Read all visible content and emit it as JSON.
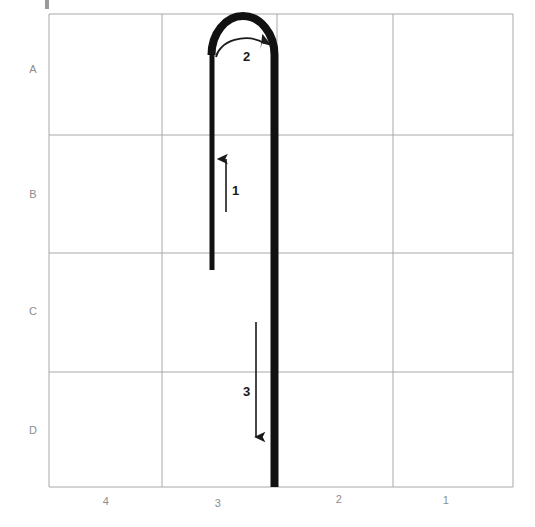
{
  "figure": {
    "title": "",
    "type": "stroke-order-diagram",
    "background_color": "#ffffff",
    "grid_color": "#a8a8a8",
    "stroke_color": "#111111",
    "label_color": "#8d8d8d",
    "step_label_color": "#1a1a1a"
  },
  "grid": {
    "columns": 4,
    "rows": 4,
    "left": 49,
    "top": 14,
    "right": 513,
    "bottom": 487,
    "v_lines": [
      49,
      162,
      277,
      393,
      513
    ],
    "h_lines": [
      14,
      135,
      253,
      372,
      487
    ],
    "row_labels": [
      {
        "text": "A",
        "x": 33,
        "y": 64
      },
      {
        "text": "B",
        "x": 33,
        "y": 189
      },
      {
        "text": "C",
        "x": 33,
        "y": 306
      },
      {
        "text": "D",
        "x": 33,
        "y": 425
      }
    ],
    "column_labels": [
      {
        "text": "4",
        "x": 106,
        "y": 496
      },
      {
        "text": "3",
        "x": 218,
        "y": 498
      },
      {
        "text": "2",
        "x": 339,
        "y": 494
      },
      {
        "text": "1",
        "x": 446,
        "y": 495
      }
    ]
  },
  "strokes": {
    "main_path_description": "Vertical line up from C-row to top of A-row, U-turn clockwise over the top, then long vertical line down to bottom border",
    "path_d": "M 212 270 L 212 53 A 33 33 0 0 1 274 53 L 274 487",
    "stroke_width_left": 5,
    "stroke_width_right": 8
  },
  "annotations": {
    "steps": [
      {
        "number": "1",
        "direction": "up",
        "label_x": 232,
        "label_y": 184,
        "arrow_from_x": 226,
        "arrow_from_y": 212,
        "arrow_to_x": 226,
        "arrow_to_y": 159
      },
      {
        "number": "2",
        "direction": "clockwise-arc",
        "label_x": 243,
        "label_y": 50,
        "arc_d": "M 216 57 A 30 22 0 0 1 264 43"
      },
      {
        "number": "3",
        "direction": "down",
        "label_x": 243,
        "label_y": 385,
        "arrow_from_x": 256,
        "arrow_from_y": 322,
        "arrow_to_x": 256,
        "arrow_to_y": 437
      }
    ]
  },
  "corner_mark": {
    "x": 45,
    "y": 0,
    "width": 4,
    "height": 9,
    "color": "#9a9a9a"
  }
}
